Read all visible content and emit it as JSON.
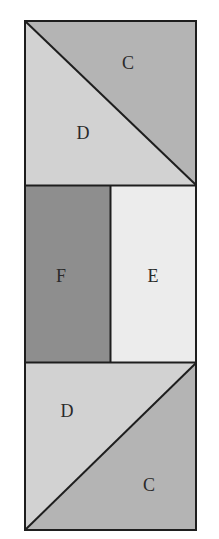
{
  "diagram": {
    "title": "",
    "colors": {
      "C": "#b4b4b4",
      "D": "#d2d2d2",
      "E": "#ececec",
      "F": "#8e8e8e",
      "stroke": "#1e1e1e",
      "background": "#ffffff"
    },
    "blocks": [
      {
        "name": "top-square",
        "split": "diagonal top-left to bottom-right",
        "regions": [
          {
            "label": "C",
            "position": "upper-right triangle"
          },
          {
            "label": "D",
            "position": "lower-left triangle"
          }
        ]
      },
      {
        "name": "middle-rectangle",
        "split": "vertical",
        "regions": [
          {
            "label": "F",
            "position": "left rectangle"
          },
          {
            "label": "E",
            "position": "right rectangle"
          }
        ]
      },
      {
        "name": "bottom-square",
        "split": "diagonal bottom-left to top-right",
        "regions": [
          {
            "label": "D",
            "position": "upper-left triangle"
          },
          {
            "label": "C",
            "position": "lower-right triangle"
          }
        ]
      }
    ]
  }
}
